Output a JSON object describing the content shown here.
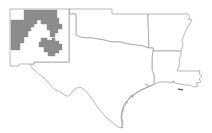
{
  "map": {
    "region": "South Central United States",
    "states": [
      {
        "id": "new-mexico",
        "name": "New Mexico"
      },
      {
        "id": "texas",
        "name": "Texas"
      },
      {
        "id": "oklahoma",
        "name": "Oklahoma"
      },
      {
        "id": "arkansas",
        "name": "Arkansas"
      },
      {
        "id": "louisiana",
        "name": "Louisiana"
      }
    ],
    "highlighted_state": "New Mexico",
    "highlight_color": "#8c8c8c",
    "border_color": "#9a9a9a",
    "background_color": "#ffffff",
    "highlighted_areas": [
      {
        "id": "nm-northwest-counties",
        "description": "Northwest / north-central New Mexico counties"
      },
      {
        "id": "nm-central-counties",
        "description": "Central New Mexico counties"
      }
    ]
  }
}
